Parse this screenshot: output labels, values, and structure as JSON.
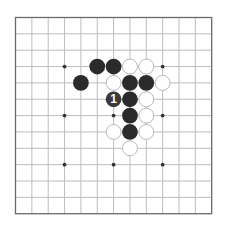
{
  "board": {
    "size": 13,
    "origin_x": 15.5,
    "origin_y": 17.5,
    "spacing": 16.35,
    "line_color": "#bdbdbd",
    "border_color": "#6a6a6a",
    "background": "#ffffff",
    "star_points": [
      [
        3,
        3
      ],
      [
        3,
        9
      ],
      [
        6,
        3
      ],
      [
        6,
        6
      ],
      [
        6,
        9
      ],
      [
        9,
        3
      ],
      [
        9,
        6
      ],
      [
        9,
        9
      ]
    ],
    "star_color": "#333333"
  },
  "stones": {
    "black_color": "#2b2b2b",
    "white_fill": "#ffffff",
    "white_stroke": "#b0b0b0",
    "black": [
      [
        3,
        5
      ],
      [
        3,
        6
      ],
      [
        4,
        4
      ],
      [
        4,
        7
      ],
      [
        4,
        8
      ],
      [
        5,
        7
      ],
      [
        6,
        7
      ],
      [
        7,
        7
      ]
    ],
    "white": [
      [
        3,
        7
      ],
      [
        3,
        8
      ],
      [
        4,
        6
      ],
      [
        4,
        9
      ],
      [
        5,
        8
      ],
      [
        6,
        8
      ],
      [
        7,
        6
      ],
      [
        7,
        8
      ],
      [
        8,
        7
      ]
    ],
    "numbered": [
      {
        "row": 5,
        "col": 6,
        "color": "black",
        "label": "1",
        "fill": "#3a3a3a",
        "text_color": "#ffffff"
      }
    ]
  }
}
